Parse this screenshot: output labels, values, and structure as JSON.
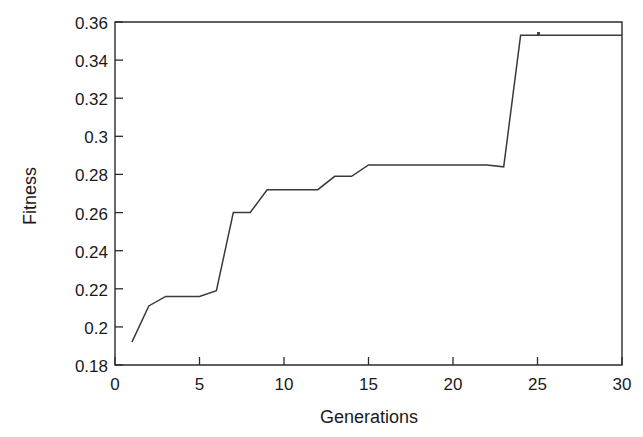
{
  "chart_data": {
    "type": "line",
    "title": "",
    "xlabel": "Generations",
    "ylabel": "Fitness",
    "xlim": [
      0,
      30
    ],
    "ylim": [
      0.18,
      0.36
    ],
    "xticks": [
      0,
      5,
      10,
      15,
      20,
      25,
      30
    ],
    "yticks": [
      0.18,
      0.2,
      0.22,
      0.24,
      0.26,
      0.28,
      0.3,
      0.32,
      0.34,
      0.36
    ],
    "xtick_labels": [
      "0",
      "5",
      "10",
      "15",
      "20",
      "25",
      "30"
    ],
    "ytick_labels": [
      "0.18",
      "0.2",
      "0.22",
      "0.24",
      "0.26",
      "0.28",
      "0.3",
      "0.32",
      "0.34",
      "0.36"
    ],
    "grid": false,
    "legend": null,
    "line_color": "#3a3a3a",
    "x": [
      1,
      2,
      3,
      4,
      5,
      6,
      7,
      8,
      9,
      10,
      11,
      12,
      13,
      14,
      15,
      16,
      17,
      18,
      19,
      20,
      21,
      22,
      23,
      24,
      25,
      26,
      27,
      28,
      29,
      30
    ],
    "series": [
      {
        "name": "Best fitness",
        "values": [
          0.192,
          0.211,
          0.216,
          0.216,
          0.216,
          0.219,
          0.26,
          0.26,
          0.272,
          0.272,
          0.272,
          0.272,
          0.279,
          0.279,
          0.285,
          0.285,
          0.285,
          0.285,
          0.285,
          0.285,
          0.285,
          0.285,
          0.284,
          0.353,
          0.353,
          0.353,
          0.353,
          0.353,
          0.353,
          0.353
        ]
      }
    ]
  },
  "axes": {
    "y_title": "Fitness",
    "x_title": "Generations"
  }
}
